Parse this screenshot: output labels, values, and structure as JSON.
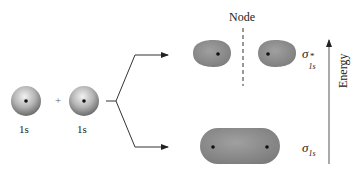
{
  "atoms": [
    {
      "label": "1s"
    },
    {
      "label": "1s"
    }
  ],
  "plus_sign": "+",
  "node_label": "Node",
  "orbitals": {
    "antibonding": {
      "symbol": "σ",
      "superscript": "*",
      "subscript": "1s"
    },
    "bonding": {
      "symbol": "σ",
      "subscript": "1s"
    }
  },
  "axis": {
    "label": "Energy"
  },
  "colors": {
    "orbital_fill": "#8e8e8e",
    "nucleus": "#1a1a1a",
    "lines": "#333333"
  }
}
